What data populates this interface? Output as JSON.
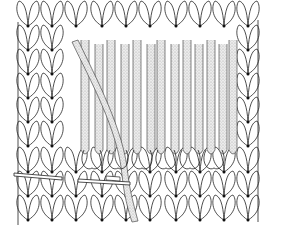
{
  "illustration": {
    "subject": "knitting stitch diagram - grafting / duplicate stitch with yarn and needles",
    "colors": {
      "background": "#ffffff",
      "line": "#222222",
      "yarn_fill": "#e4e4e4",
      "yarn_stipple": "#9a9a9a"
    },
    "grid": {
      "columns": [
        28,
        52,
        76,
        102,
        126,
        150,
        176,
        200,
        224,
        248
      ],
      "row_nodes": [
        26,
        50,
        74,
        98,
        122,
        146,
        172,
        196,
        220
      ],
      "stitch_half_width": 12
    },
    "needle_left": {
      "x1": 14,
      "y1": 173,
      "x2": 62,
      "y2": 177
    },
    "needle_tapestry": {
      "x1": 78,
      "y1": 179,
      "x2": 130,
      "y2": 182
    }
  }
}
